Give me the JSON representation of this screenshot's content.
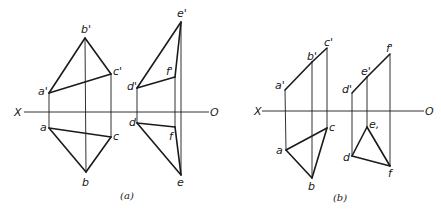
{
  "figure": {
    "style": {
      "stroke_color": "#1a1a1a",
      "background": "#ffffff"
    },
    "panels": [
      {
        "id": "a",
        "caption": "(a)",
        "caption_pos": [
          127,
          199
        ],
        "axis": {
          "x_label": "X",
          "o_label": "O",
          "y": 112,
          "x_start": 24,
          "x_end": 209,
          "x_label_pos": [
            14,
            116
          ],
          "o_label_pos": [
            210,
            116
          ]
        },
        "points": {
          "a'": [
            49,
            93
          ],
          "b'": [
            85,
            38
          ],
          "c'": [
            111,
            74
          ],
          "a": [
            49,
            128
          ],
          "b": [
            86,
            172
          ],
          "c": [
            111,
            137
          ],
          "d'": [
            137,
            88
          ],
          "e'": [
            181,
            22
          ],
          "f'": [
            175,
            77
          ],
          "d": [
            137,
            123
          ],
          "e": [
            181,
            175
          ],
          "f": [
            175,
            127
          ]
        },
        "labels": [
          {
            "text": "b'",
            "pos": [
              81,
              33
            ]
          },
          {
            "text": "c'",
            "pos": [
              113,
              75
            ]
          },
          {
            "text": "a'",
            "pos": [
              38,
              95
            ]
          },
          {
            "text": "a",
            "pos": [
              40,
              131
            ]
          },
          {
            "text": "c",
            "pos": [
              113,
              140
            ]
          },
          {
            "text": "b",
            "pos": [
              82,
              186
            ]
          },
          {
            "text": "e'",
            "pos": [
              177,
              17
            ]
          },
          {
            "text": "f'",
            "pos": [
              166,
              75
            ]
          },
          {
            "text": "d'",
            "pos": [
              127,
              90
            ]
          },
          {
            "text": "d",
            "pos": [
              129,
              126
            ]
          },
          {
            "text": "f",
            "pos": [
              169,
              140
            ]
          },
          {
            "text": "e",
            "pos": [
              177,
              186
            ]
          }
        ],
        "edges": [
          [
            "a'",
            "b'"
          ],
          [
            "b'",
            "c'"
          ],
          [
            "c'",
            "a'"
          ],
          [
            "a",
            "b"
          ],
          [
            "b",
            "c"
          ],
          [
            "c",
            "a"
          ],
          [
            "d'",
            "e'"
          ],
          [
            "e'",
            "f'"
          ],
          [
            "f'",
            "d'"
          ],
          [
            "d",
            "e"
          ],
          [
            "e",
            "f"
          ],
          [
            "f",
            "d"
          ]
        ],
        "projectors": [
          [
            "a'",
            "a"
          ],
          [
            "b'",
            "b"
          ],
          [
            "c'",
            "c"
          ],
          [
            "d'",
            "d"
          ],
          [
            "e'",
            "e"
          ],
          [
            "f'",
            "f"
          ]
        ]
      },
      {
        "id": "b",
        "caption": "(b)",
        "caption_pos": [
          340,
          201
        ],
        "axis": {
          "x_label": "X",
          "o_label": "O",
          "y": 111,
          "x_start": 262,
          "x_end": 424,
          "x_label_pos": [
            254,
            115
          ],
          "o_label_pos": [
            425,
            115
          ]
        },
        "points": {
          "a'": [
            285,
            90
          ],
          "b'": [
            312,
            62
          ],
          "c'": [
            327,
            48
          ],
          "a": [
            286,
            150
          ],
          "b": [
            312,
            178
          ],
          "c": [
            327,
            128
          ],
          "d'": [
            352,
            93
          ],
          "e'": [
            367,
            77
          ],
          "f'": [
            390,
            54
          ],
          "d": [
            352,
            156
          ],
          "e": [
            367,
            127
          ],
          "f": [
            390,
            166
          ]
        },
        "labels": [
          {
            "text": "a'",
            "pos": [
              275,
              89
            ]
          },
          {
            "text": "b'",
            "pos": [
              307,
              60
            ]
          },
          {
            "text": "c'",
            "pos": [
              324,
              46
            ]
          },
          {
            "text": "c",
            "pos": [
              329,
              131
            ]
          },
          {
            "text": "a",
            "pos": [
              276,
              154
            ]
          },
          {
            "text": "b",
            "pos": [
              308,
              190
            ]
          },
          {
            "text": "d'",
            "pos": [
              342,
              93
            ]
          },
          {
            "text": "e'",
            "pos": [
              361,
              75
            ]
          },
          {
            "text": "f'",
            "pos": [
              386,
              52
            ]
          },
          {
            "text": "e,",
            "pos": [
              369,
              128
            ]
          },
          {
            "text": "d",
            "pos": [
              343,
              161
            ]
          },
          {
            "text": "f",
            "pos": [
              388,
              177
            ]
          }
        ],
        "edges": [
          [
            "a'",
            "b'"
          ],
          [
            "b'",
            "c'"
          ],
          [
            "a",
            "b"
          ],
          [
            "b",
            "c"
          ],
          [
            "c",
            "a"
          ],
          [
            "d'",
            "e'"
          ],
          [
            "e'",
            "f'"
          ],
          [
            "d",
            "e"
          ],
          [
            "e",
            "f"
          ],
          [
            "f",
            "d"
          ]
        ],
        "projectors": [
          [
            "a'",
            "a"
          ],
          [
            "b'",
            "b"
          ],
          [
            "c'",
            "c"
          ],
          [
            "d'",
            "d"
          ],
          [
            "e'",
            "e"
          ],
          [
            "f'",
            "f"
          ]
        ]
      }
    ]
  }
}
